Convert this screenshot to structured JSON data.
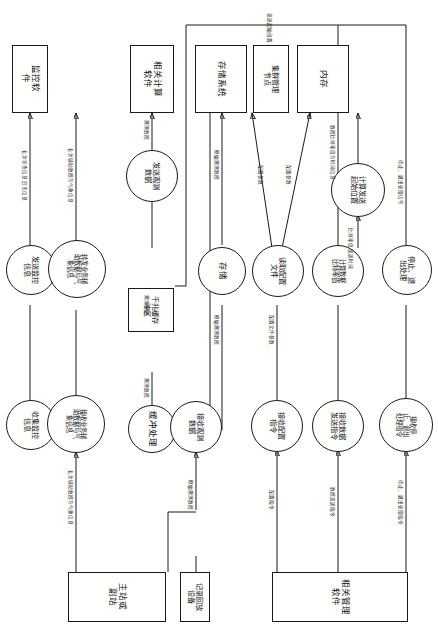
{
  "diagram": {
    "title_note": "观测数据接收、缓冲、存储与管理流程图",
    "orientation": "rotated-90",
    "colors": {
      "stroke": "#1a1a1a",
      "background": "#ffffff",
      "text": "#111111"
    },
    "external_systems": [
      {
        "id": "monitor_sw",
        "label": "监控软件",
        "shape": "rect"
      },
      {
        "id": "calc_sw",
        "label": "相关计算\n软件",
        "shape": "rect"
      },
      {
        "id": "storage_sys",
        "label": "存储系统",
        "shape": "rect"
      },
      {
        "id": "cluster_node",
        "label": "集群管理\n节点",
        "shape": "rect"
      },
      {
        "id": "memory",
        "label": "内存",
        "shape": "rect"
      },
      {
        "id": "main_station",
        "label": "主站或\n副站",
        "shape": "rect"
      },
      {
        "id": "replay_device",
        "label": "记录回放\n设备",
        "shape": "rect"
      },
      {
        "id": "mgmt_sw",
        "label": "相关管理\n软件",
        "shape": "rect"
      }
    ],
    "processes": [
      {
        "id": "send_monitor",
        "label": "发送监控\n信息",
        "shape": "circle"
      },
      {
        "id": "forward_aux",
        "label": "转发业务辅\n助数据与气\n象信息",
        "shape": "circle"
      },
      {
        "id": "send_obs",
        "label": "发送观测\n数据",
        "shape": "circle"
      },
      {
        "id": "store",
        "label": "存储",
        "shape": "circle"
      },
      {
        "id": "read_config",
        "label": "读取配置\n文件",
        "shape": "circle"
      },
      {
        "id": "calc_bitrate",
        "label": "计算数据\n比特率值",
        "shape": "circle"
      },
      {
        "id": "calc_start_pos",
        "label": "计算发送\n起始位置",
        "shape": "circle"
      },
      {
        "id": "stop_exit",
        "label": "停止、退\n出处理",
        "shape": "circle"
      },
      {
        "id": "collect_monitor",
        "label": "收集监控\n信息",
        "shape": "circle"
      },
      {
        "id": "recv_aux",
        "label": "接收业务辅\n助数据与气\n象信息",
        "shape": "circle"
      },
      {
        "id": "buffer_proc",
        "label": "缓冲处理",
        "shape": "circle"
      },
      {
        "id": "recv_obs",
        "label": "接收观测\n数据",
        "shape": "circle"
      },
      {
        "id": "recv_cfg_cmd",
        "label": "接收配置\n指令",
        "shape": "circle"
      },
      {
        "id": "recv_send_cmd",
        "label": "接收数据\n发送指令",
        "shape": "circle"
      },
      {
        "id": "recv_stop_cmd",
        "label": "接收停\n止、退出\n处理指令",
        "shape": "circle"
      }
    ],
    "data_stores": [
      {
        "id": "ring_buffer",
        "label": "千兆缓存\n冲区",
        "shape": "rect"
      }
    ],
    "edge_labels": [
      {
        "id": "l_status_log",
        "text": "业务状态信息\n日志信息"
      },
      {
        "id": "l_aux_met_up",
        "text": "业务辅助数据与气象信息"
      },
      {
        "id": "l_obs_1",
        "text": "观测数据"
      },
      {
        "id": "l_obs_2",
        "text": "观测数据"
      },
      {
        "id": "l_obs_3",
        "text": "观测数据"
      },
      {
        "id": "l_raw_obs_1",
        "text": "原始观测数据"
      },
      {
        "id": "l_raw_obs_2",
        "text": "原始观测数据"
      },
      {
        "id": "l_raw_obs_3",
        "text": "原始观测数据"
      },
      {
        "id": "l_cfg_param_1",
        "text": "配置参数"
      },
      {
        "id": "l_cfg_param_2",
        "text": "配置参数"
      },
      {
        "id": "l_cfg_param_3",
        "text": "配置文件参数"
      },
      {
        "id": "l_bitrate_val",
        "text": "数据比特率值与时间信息"
      },
      {
        "id": "l_start_pos_top",
        "text": "发送起始位置"
      },
      {
        "id": "l_aux_met_low",
        "text": "业务辅助数据与气象信息"
      },
      {
        "id": "l_cfg_cmd",
        "text": "配置指令"
      },
      {
        "id": "l_send_cmd",
        "text": "数据发送指令"
      },
      {
        "id": "l_stop_cmd",
        "text": "停止、退出处理指令"
      },
      {
        "id": "l_time_send",
        "text": "比特率值\n发送时间"
      },
      {
        "id": "l_stop_sig",
        "text": "停止、退出处理信号"
      }
    ]
  }
}
